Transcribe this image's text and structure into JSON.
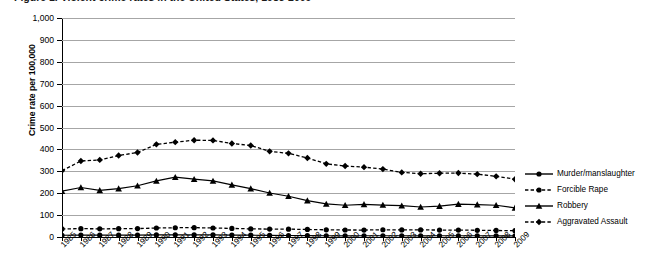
{
  "chart_data": {
    "type": "line",
    "title": "Figure 1. Violent crime rates in the United States, 1985-2009",
    "xlabel": "",
    "ylabel": "Crime rate per 100,000",
    "ylim": [
      0,
      1000
    ],
    "yticks": [
      "0",
      "100",
      "200",
      "300",
      "400",
      "500",
      "600",
      "700",
      "800",
      "900",
      "1,000"
    ],
    "ytick_values": [
      0,
      100,
      200,
      300,
      400,
      500,
      600,
      700,
      800,
      900,
      1000
    ],
    "grid": true,
    "legend_position": "right",
    "categories": [
      "1985",
      "1986",
      "1987",
      "1988",
      "1989",
      "1990",
      "1991",
      "1992",
      "1993",
      "1994",
      "1995",
      "1996",
      "1997",
      "1998",
      "1999",
      "2000",
      "2001",
      "2002",
      "2003",
      "2004",
      "2005",
      "2006",
      "2007",
      "2008",
      "2009"
    ],
    "series": [
      {
        "name": "Murder/manslaughter",
        "marker": "circle",
        "line_style": "solid",
        "color": "#000000",
        "values": [
          8.0,
          8.6,
          8.3,
          8.4,
          8.7,
          9.4,
          9.8,
          9.3,
          9.5,
          9.0,
          8.2,
          7.4,
          6.8,
          6.3,
          5.7,
          5.5,
          5.6,
          5.6,
          5.7,
          5.5,
          5.6,
          5.8,
          5.7,
          5.4,
          5.0
        ]
      },
      {
        "name": "Forcible Rape",
        "marker": "circle",
        "line_style": "dashed",
        "color": "#000000",
        "values": [
          37.1,
          38.1,
          37.4,
          37.8,
          38.3,
          41.1,
          42.3,
          42.8,
          41.1,
          39.3,
          37.1,
          36.3,
          35.9,
          34.5,
          32.8,
          32.0,
          31.8,
          33.1,
          32.3,
          32.4,
          31.8,
          31.6,
          30.6,
          29.8,
          28.7
        ]
      },
      {
        "name": "Robbery",
        "marker": "triangle",
        "line_style": "solid",
        "color": "#000000",
        "values": [
          209,
          226,
          213,
          221,
          234,
          256,
          273,
          264,
          256,
          238,
          221,
          201,
          186,
          166,
          151,
          145,
          149,
          146,
          143,
          137,
          141,
          150,
          148,
          145,
          133
        ]
      },
      {
        "name": "Aggravated Assault",
        "marker": "diamond",
        "line_style": "dashed",
        "color": "#000000",
        "values": [
          303,
          347,
          352,
          372,
          386,
          423,
          433,
          442,
          441,
          427,
          418,
          391,
          382,
          361,
          334,
          324,
          319,
          310,
          295,
          289,
          291,
          292,
          287,
          277,
          264
        ]
      }
    ]
  },
  "legend": {
    "items": [
      {
        "label": "Murder/manslaughter",
        "marker": "circle",
        "line_style": "solid"
      },
      {
        "label": "Forcible Rape",
        "marker": "circle",
        "line_style": "dashed"
      },
      {
        "label": "Robbery",
        "marker": "triangle",
        "line_style": "solid"
      },
      {
        "label": "Aggravated Assault",
        "marker": "diamond",
        "line_style": "dashed"
      }
    ]
  }
}
